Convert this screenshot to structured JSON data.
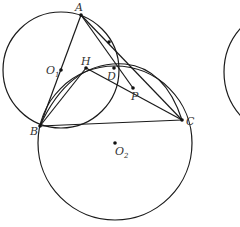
{
  "diagram": {
    "type": "geometry",
    "stroke_color": "#1a1a1a",
    "points": [
      {
        "id": "A",
        "label": "A",
        "x": 81,
        "y": 15,
        "lx": 75,
        "ly": 11
      },
      {
        "id": "B",
        "label": "B",
        "x": 40,
        "y": 126,
        "lx": 30,
        "ly": 135
      },
      {
        "id": "C",
        "label": "C",
        "x": 182,
        "y": 120,
        "lx": 186,
        "ly": 125
      },
      {
        "id": "D",
        "label": "D",
        "x": 114,
        "y": 68,
        "lx": 107,
        "ly": 80
      },
      {
        "id": "H",
        "label": "H",
        "x": 86,
        "y": 68,
        "lx": 81,
        "ly": 65
      },
      {
        "id": "P",
        "label": "P",
        "x": 133,
        "y": 88,
        "lx": 131,
        "ly": 100
      },
      {
        "id": "E",
        "label": "",
        "x": 109,
        "y": 42,
        "lx": 0,
        "ly": 0
      },
      {
        "id": "O1",
        "label": "O",
        "sub": "1",
        "x": 61,
        "y": 70,
        "lx": 46,
        "ly": 74
      },
      {
        "id": "O2",
        "label": "O",
        "sub": "2",
        "x": 115,
        "y": 143,
        "lx": 115,
        "ly": 155
      }
    ],
    "circles": [
      {
        "id": "circle-O1",
        "cx": 61,
        "cy": 70,
        "r": 58
      },
      {
        "id": "circle-O2",
        "cx": 115,
        "cy": 143,
        "r": 77
      },
      {
        "id": "circle-right-partial",
        "cx": 290,
        "cy": 72,
        "r": 66
      }
    ],
    "arcs": [
      {
        "id": "arc-BHDC",
        "d": "M40,126 Q70,60 125,64 Q165,68 182,120"
      }
    ],
    "segments": [
      {
        "id": "AB",
        "from": "A",
        "to": "B"
      },
      {
        "id": "AC",
        "from": "A",
        "to": "C"
      },
      {
        "id": "AP",
        "from": "A",
        "to": "P"
      },
      {
        "id": "BC",
        "from": "B",
        "to": "C"
      },
      {
        "id": "BH",
        "from": "B",
        "to": "H"
      },
      {
        "id": "HC",
        "from": "H",
        "to": "C"
      }
    ]
  }
}
